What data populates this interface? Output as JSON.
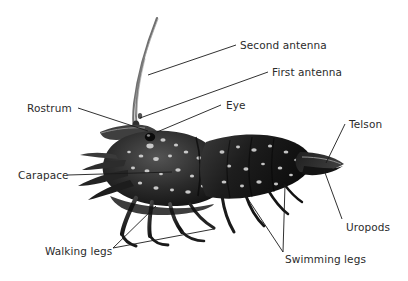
{
  "figure": {
    "kind": "labeled-anatomy-photograph",
    "background_color": "#ffffff",
    "text_color": "#2b2b2b",
    "leader_line_color": "#1a1a1a",
    "specimen_dark": "#171717",
    "specimen_mid": "#4a4a4a",
    "specimen_light": "#b9b9b9"
  },
  "labels": {
    "second_antenna": "Second antenna",
    "first_antenna": "First antenna",
    "rostrum": "Rostrum",
    "eye": "Eye",
    "carapace": "Carapace",
    "telson": "Telson",
    "uropods": "Uropods",
    "walking_legs": "Walking legs",
    "swimming_legs": "Swimming legs"
  }
}
